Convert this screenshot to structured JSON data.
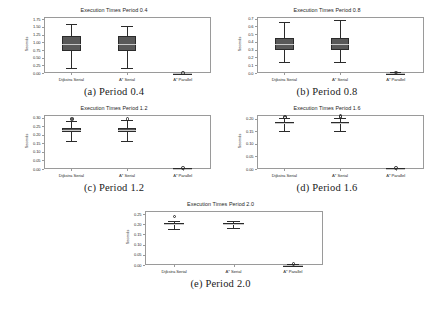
{
  "figure": {
    "background": "#ffffff",
    "series_color": "#595959",
    "line_color": "#2b2b2b",
    "axis_color": "#9a9a9a",
    "ylabel": "Seconds",
    "categories": [
      "Dijkstra Serial",
      "A* Serial",
      "A* Parallel"
    ]
  },
  "captions": [
    "(a) Period 0.4",
    "(b) Period 0.8",
    "(c) Period 1.2",
    "(d) Period 1.6",
    "(e) Period 2.0"
  ],
  "chart_data": [
    {
      "type": "box",
      "title": "Execution Times Period 0.4",
      "xlabel": "",
      "ylabel": "Seconds",
      "categories": [
        "Dijkstra Serial",
        "A* Serial",
        "A* Parallel"
      ],
      "ylim": [
        0.0,
        1.82
      ],
      "yticks": [
        "0.00",
        "0.25",
        "0.50",
        "0.75",
        "1.00",
        "1.25",
        "1.50",
        "1.75"
      ],
      "ytick_values": [
        0.0,
        0.25,
        0.5,
        0.75,
        1.0,
        1.25,
        1.5,
        1.75
      ],
      "grid": false,
      "boxes": [
        {
          "label": "Dijkstra Serial",
          "whisker_low": 0.17,
          "q1": 0.72,
          "median": 0.95,
          "q3": 1.2,
          "whisker_high": 1.58,
          "fliers": []
        },
        {
          "label": "A* Serial",
          "whisker_low": 0.17,
          "q1": 0.7,
          "median": 0.93,
          "q3": 1.2,
          "whisker_high": 1.52,
          "fliers": []
        },
        {
          "label": "A* Parallel",
          "whisker_low": 0.0,
          "q1": 0.0,
          "median": 0.0,
          "q3": 0.01,
          "whisker_high": 0.01,
          "fliers": [
            0.02
          ]
        }
      ]
    },
    {
      "type": "box",
      "title": "Execution Times Period 0.8",
      "xlabel": "",
      "ylabel": "Seconds",
      "categories": [
        "Dijkstra Serial",
        "A* Serial",
        "A* Parallel"
      ],
      "ylim": [
        0.0,
        0.72
      ],
      "yticks": [
        "0.0",
        "0.1",
        "0.2",
        "0.3",
        "0.4",
        "0.5",
        "0.6",
        "0.7"
      ],
      "ytick_values": [
        0.0,
        0.1,
        0.2,
        0.3,
        0.4,
        0.5,
        0.6,
        0.7
      ],
      "grid": false,
      "boxes": [
        {
          "label": "Dijkstra Serial",
          "whisker_low": 0.145,
          "q1": 0.295,
          "median": 0.375,
          "q3": 0.455,
          "whisker_high": 0.655,
          "fliers": []
        },
        {
          "label": "A* Serial",
          "whisker_low": 0.145,
          "q1": 0.295,
          "median": 0.375,
          "q3": 0.455,
          "whisker_high": 0.685,
          "fliers": []
        },
        {
          "label": "A* Parallel",
          "whisker_low": 0.0,
          "q1": 0.0,
          "median": 0.002,
          "q3": 0.005,
          "whisker_high": 0.008,
          "fliers": [
            0.012
          ]
        }
      ]
    },
    {
      "type": "box",
      "title": "Execution Times Period 1.2",
      "xlabel": "",
      "ylabel": "Seconds",
      "categories": [
        "Dijkstra Serial",
        "A* Serial",
        "A* Parallel"
      ],
      "ylim": [
        0.0,
        0.315
      ],
      "yticks": [
        "0.00",
        "0.05",
        "0.10",
        "0.15",
        "0.20",
        "0.25",
        "0.30"
      ],
      "ytick_values": [
        0.0,
        0.05,
        0.1,
        0.15,
        0.2,
        0.25,
        0.3
      ],
      "grid": false,
      "boxes": [
        {
          "label": "Dijkstra Serial",
          "whisker_low": 0.165,
          "q1": 0.218,
          "median": 0.229,
          "q3": 0.24,
          "whisker_high": 0.28,
          "fliers": [
            0.292,
            0.298
          ]
        },
        {
          "label": "A* Serial",
          "whisker_low": 0.163,
          "q1": 0.218,
          "median": 0.229,
          "q3": 0.24,
          "whisker_high": 0.286,
          "fliers": [
            0.296
          ]
        },
        {
          "label": "A* Parallel",
          "whisker_low": 0.0,
          "q1": 0.0,
          "median": 0.002,
          "q3": 0.004,
          "whisker_high": 0.006,
          "fliers": [
            0.009
          ]
        }
      ]
    },
    {
      "type": "box",
      "title": "Execution Times Period 1.6",
      "xlabel": "",
      "ylabel": "Seconds",
      "categories": [
        "Dijkstra Serial",
        "A* Serial",
        "A* Parallel"
      ],
      "ylim": [
        0.0,
        0.215
      ],
      "yticks": [
        "0.00",
        "0.05",
        "0.10",
        "0.15",
        "0.20"
      ],
      "ytick_values": [
        0.0,
        0.05,
        0.1,
        0.15,
        0.2
      ],
      "grid": false,
      "boxes": [
        {
          "label": "Dijkstra Serial",
          "whisker_low": 0.152,
          "q1": 0.178,
          "median": 0.184,
          "q3": 0.189,
          "whisker_high": 0.203,
          "fliers": [
            0.207,
            0.21
          ]
        },
        {
          "label": "A* Serial",
          "whisker_low": 0.15,
          "q1": 0.178,
          "median": 0.184,
          "q3": 0.189,
          "whisker_high": 0.205,
          "fliers": [
            0.208,
            0.212
          ]
        },
        {
          "label": "A* Parallel",
          "whisker_low": 0.0,
          "q1": 0.0,
          "median": 0.001,
          "q3": 0.003,
          "whisker_high": 0.005,
          "fliers": [
            0.007
          ]
        }
      ]
    },
    {
      "type": "box",
      "title": "Execution Times Period 2.0",
      "xlabel": "",
      "ylabel": "Seconds",
      "categories": [
        "Dijkstra Serial",
        "A* Serial",
        "A* Parallel"
      ],
      "ylim": [
        0.0,
        0.265
      ],
      "yticks": [
        "0.00",
        "0.05",
        "0.10",
        "0.15",
        "0.20",
        "0.25"
      ],
      "ytick_values": [
        0.0,
        0.05,
        0.1,
        0.15,
        0.2,
        0.25
      ],
      "grid": false,
      "boxes": [
        {
          "label": "Dijkstra Serial",
          "whisker_low": 0.176,
          "q1": 0.196,
          "median": 0.2,
          "q3": 0.204,
          "whisker_high": 0.218,
          "fliers": [
            0.24
          ]
        },
        {
          "label": "A* Serial",
          "whisker_low": 0.18,
          "q1": 0.196,
          "median": 0.2,
          "q3": 0.204,
          "whisker_high": 0.216,
          "fliers": []
        },
        {
          "label": "A* Parallel",
          "whisker_low": 0.0,
          "q1": 0.0,
          "median": 0.001,
          "q3": 0.002,
          "whisker_high": 0.004,
          "fliers": [
            0.006
          ]
        }
      ]
    }
  ]
}
